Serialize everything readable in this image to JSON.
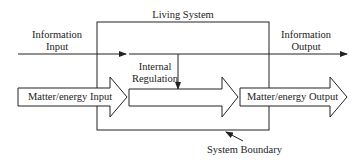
{
  "diagram": {
    "title": "Living System",
    "information_input": [
      "Information",
      "Input"
    ],
    "information_output": [
      "Information",
      "Output"
    ],
    "internal_regulation": [
      "Internal",
      "Regulation"
    ],
    "matter_input": "Matter/energy Input",
    "matter_output": "Matter/energy Output",
    "system_boundary": "System Boundary",
    "colors": {
      "stroke": "#222222",
      "fill": "#ffffff",
      "text": "#222222"
    }
  }
}
